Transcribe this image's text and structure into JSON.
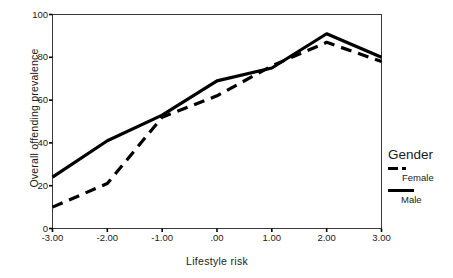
{
  "chart_data": {
    "type": "line",
    "title": "",
    "xlabel": "Lifestyle risk",
    "ylabel": "Overall offending prevalence",
    "x": [
      -3.0,
      -2.0,
      -1.0,
      0.0,
      1.0,
      2.0,
      3.0
    ],
    "xticklabels": [
      "-3.00",
      "-2.00",
      "-1.00",
      ".00",
      "1.00",
      "2.00",
      "3.00"
    ],
    "yticklabels": [
      "0",
      "20",
      "40",
      "60",
      "80",
      "100"
    ],
    "yticks": [
      0,
      20,
      40,
      60,
      80,
      100
    ],
    "xlim": [
      -3.0,
      3.0
    ],
    "ylim": [
      0,
      100
    ],
    "grid": false,
    "legend_position": "right",
    "legend_title": "Gender",
    "series": [
      {
        "name": "Female",
        "style": "dashed",
        "color": "#000000",
        "values": [
          10,
          21,
          52,
          62,
          76,
          87,
          78
        ]
      },
      {
        "name": "Male",
        "style": "solid",
        "color": "#000000",
        "values": [
          24,
          41,
          53,
          69,
          75,
          91,
          80
        ]
      }
    ]
  },
  "axis": {
    "frame_color": "#2b2b2b",
    "tick_color": "#000000"
  }
}
